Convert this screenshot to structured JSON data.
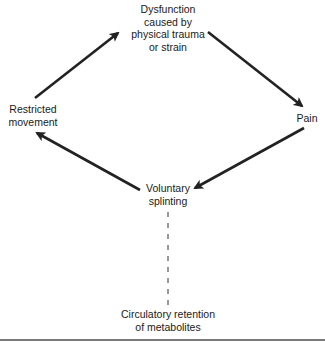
{
  "diagram": {
    "type": "cycle",
    "nodes": [
      {
        "id": "dysfunction",
        "lines": [
          "Dysfunction",
          "caused by",
          "physical trauma",
          "or strain"
        ]
      },
      {
        "id": "pain",
        "lines": [
          "Pain"
        ]
      },
      {
        "id": "voluntary_splinting",
        "lines": [
          "Voluntary",
          "splinting"
        ]
      },
      {
        "id": "restricted_movement",
        "lines": [
          "Restricted",
          "movement"
        ]
      },
      {
        "id": "circulatory_retention",
        "lines": [
          "Circulatory retention",
          "of metabolites"
        ]
      }
    ],
    "edges": [
      {
        "from": "dysfunction",
        "to": "pain",
        "style": "solid-arrow"
      },
      {
        "from": "pain",
        "to": "voluntary_splinting",
        "style": "solid-arrow"
      },
      {
        "from": "voluntary_splinting",
        "to": "restricted_movement",
        "style": "solid-arrow"
      },
      {
        "from": "restricted_movement",
        "to": "dysfunction",
        "style": "solid-arrow"
      },
      {
        "from": "voluntary_splinting",
        "to": "circulatory_retention",
        "style": "dashed-line"
      }
    ],
    "colors": {
      "line": "#222222",
      "text": "#1a1a1a",
      "rule": "#7a7a7a"
    }
  }
}
